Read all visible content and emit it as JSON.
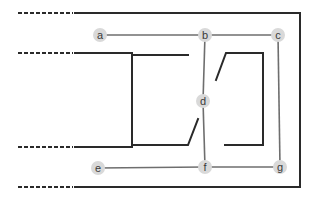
{
  "diagram": {
    "nodes": [
      {
        "id": "a",
        "label": "a",
        "x": 100,
        "y": 35
      },
      {
        "id": "b",
        "label": "b",
        "x": 205,
        "y": 35
      },
      {
        "id": "c",
        "label": "c",
        "x": 278,
        "y": 35
      },
      {
        "id": "d",
        "label": "d",
        "x": 203,
        "y": 101
      },
      {
        "id": "e",
        "label": "e",
        "x": 98,
        "y": 168
      },
      {
        "id": "f",
        "label": "f",
        "x": 205,
        "y": 167
      },
      {
        "id": "g",
        "label": "g",
        "x": 280,
        "y": 167
      }
    ],
    "edges": [
      [
        "a",
        "b"
      ],
      [
        "b",
        "c"
      ],
      [
        "b",
        "d"
      ],
      [
        "d",
        "f"
      ],
      [
        "c",
        "g"
      ],
      [
        "e",
        "f"
      ],
      [
        "f",
        "g"
      ]
    ],
    "colors": {
      "wall": "#2a2a2a",
      "edge": "#6e6e6e",
      "node_fill": "#d9d9d9",
      "node_text": "#3a3a3a"
    }
  }
}
